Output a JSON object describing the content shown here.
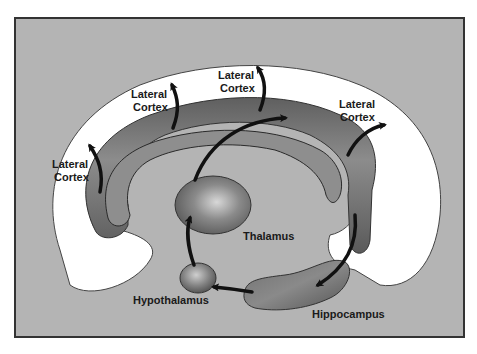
{
  "diagram": {
    "type": "neural-circuit",
    "colors": {
      "panel": "#b4b4b4",
      "cortex_band": "#ffffff",
      "structures": "#7a7a7a",
      "arrows": "#111111",
      "border": "#333333"
    },
    "labels": {
      "lateral_cortex_1": [
        "Lateral",
        "Cortex"
      ],
      "lateral_cortex_2": [
        "Lateral",
        "Cortex"
      ],
      "lateral_cortex_3": [
        "Lateral",
        "Cortex"
      ],
      "lateral_cortex_4": [
        "Lateral",
        "Cortex"
      ],
      "thalamus": "Thalamus",
      "hypothalamus": "Hypothalamus",
      "hippocampus": "Hippocampus"
    },
    "nodes": [
      "Hypothalamus",
      "Thalamus",
      "Cingulate",
      "Hippocampus",
      "Lateral Cortex"
    ],
    "edges": [
      [
        "Hypothalamus",
        "Thalamus"
      ],
      [
        "Thalamus",
        "Cingulate"
      ],
      [
        "Cingulate",
        "Hippocampus"
      ],
      [
        "Hippocampus",
        "Hypothalamus"
      ],
      [
        "Cingulate",
        "Lateral Cortex"
      ]
    ]
  }
}
